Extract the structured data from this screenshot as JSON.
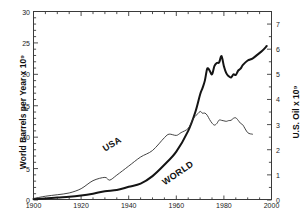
{
  "chart_data": {
    "type": "line",
    "title": "",
    "xlabel": "",
    "ylabel": "World Barrels per Year x 10⁹",
    "ylabel_right": "U.S. Oil x 10⁹",
    "xlim": [
      1900,
      2000
    ],
    "ylim": [
      0,
      30
    ],
    "ylim_right": [
      0,
      7.5
    ],
    "grid": false,
    "legend": "inline-curve-labels",
    "xticks": [
      1900,
      1920,
      1940,
      1960,
      1980,
      2000
    ],
    "xticklabels": [
      "1900",
      "1920",
      "1940",
      "1960",
      "1980",
      "2000"
    ],
    "yticks": [
      0,
      5,
      10,
      15,
      20,
      25,
      30
    ],
    "yticklabels": [
      "0",
      "5",
      "10",
      "15",
      "20",
      "25",
      "30"
    ],
    "yticks_right": [
      0,
      1,
      2,
      3,
      4,
      5,
      6,
      7
    ],
    "yticklabels_right": [
      "0",
      "1",
      "2",
      "3",
      "4",
      "5",
      "6",
      "7"
    ],
    "series": [
      {
        "name": "WORLD",
        "axis": "left",
        "units": "World Barrels per Year x 10^9",
        "linewidth": "thick",
        "color": "#141414",
        "x": [
          1900,
          1905,
          1910,
          1915,
          1920,
          1925,
          1930,
          1935,
          1940,
          1945,
          1950,
          1955,
          1960,
          1965,
          1968,
          1970,
          1971,
          1972,
          1973,
          1974,
          1975,
          1976,
          1977,
          1978,
          1979,
          1980,
          1981,
          1982,
          1983,
          1984,
          1985,
          1986,
          1987,
          1988,
          1990,
          1992,
          1994,
          1996,
          1998
        ],
        "values": [
          0.15,
          0.25,
          0.4,
          0.5,
          0.7,
          1.0,
          1.4,
          1.6,
          2.1,
          2.6,
          3.8,
          5.6,
          7.7,
          11.0,
          14.0,
          16.8,
          17.8,
          19.0,
          20.9,
          20.6,
          20.0,
          21.3,
          21.8,
          21.9,
          22.9,
          21.3,
          20.2,
          19.7,
          19.5,
          20.0,
          19.9,
          20.6,
          20.9,
          21.5,
          22.2,
          22.5,
          23.1,
          23.7,
          24.5
        ]
      },
      {
        "name": "USA",
        "axis": "right",
        "units": "U.S. Oil x 10^9",
        "linewidth": "thin",
        "color": "#2a2a2a",
        "x": [
          1900,
          1905,
          1910,
          1915,
          1920,
          1925,
          1930,
          1932,
          1935,
          1940,
          1945,
          1950,
          1955,
          1957,
          1960,
          1962,
          1965,
          1967,
          1968,
          1970,
          1971,
          1972,
          1973,
          1974,
          1975,
          1976,
          1977,
          1978,
          1979,
          1980,
          1981,
          1982,
          1983,
          1984,
          1985,
          1986,
          1987,
          1988,
          1990,
          1992
        ],
        "values_right_axis": [
          0.06,
          0.15,
          0.21,
          0.28,
          0.45,
          0.77,
          0.9,
          0.79,
          0.99,
          1.35,
          1.71,
          1.97,
          2.48,
          2.62,
          2.57,
          2.68,
          2.85,
          3.22,
          3.33,
          3.52,
          3.45,
          3.46,
          3.37,
          3.2,
          3.06,
          2.98,
          3.04,
          3.18,
          3.17,
          3.15,
          3.13,
          3.16,
          3.17,
          3.25,
          3.27,
          3.17,
          3.05,
          2.98,
          2.68,
          2.62
        ]
      }
    ],
    "annotations": [
      {
        "text": "USA",
        "near_year": 1938,
        "rotated": true
      },
      {
        "text": "WORLD",
        "near_year": 1955,
        "rotated": true
      }
    ]
  },
  "axes": {
    "left_title": "World Barrels per Year x 10⁹",
    "right_title": "U.S. Oil x 10⁹"
  },
  "caption": {
    "text": " "
  }
}
